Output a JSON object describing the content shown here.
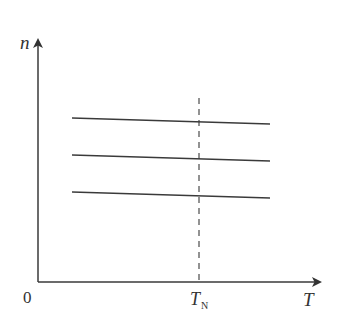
{
  "figure": {
    "y_axis_label": "n",
    "x_axis_label": "T",
    "origin_label": "0",
    "marker_label_main": "T",
    "marker_label_sub": "N",
    "line_color": "#3a3a3a"
  },
  "diagram": {
    "type": "line-sketch",
    "axes": {
      "origin_px": [
        38,
        282
      ],
      "y_axis_top_px": 36,
      "x_axis_right_px": 322
    },
    "curves": [
      {
        "name": "upper-level",
        "from_px": [
          72,
          118
        ],
        "to_px": [
          270,
          124
        ]
      },
      {
        "name": "middle-level",
        "from_px": [
          72,
          155
        ],
        "to_px": [
          270,
          161
        ]
      },
      {
        "name": "lower-level",
        "from_px": [
          72,
          192
        ],
        "to_px": [
          270,
          198
        ]
      }
    ],
    "marker_line": {
      "label": "T_N",
      "x_px": 199,
      "y_top_px": 98,
      "style": "dashed"
    }
  }
}
